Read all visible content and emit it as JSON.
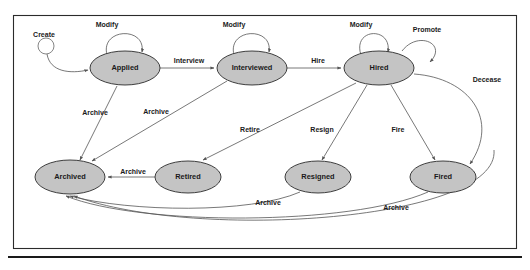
{
  "diagram": {
    "colors": {
      "node_fill": "#c4c4c4",
      "node_stroke": "#2b2b2b",
      "edge_stroke": "#555555",
      "background": "#ffffff",
      "frame": "#2b2b2b"
    },
    "start_node": {
      "label": "Create",
      "name": "start-node"
    },
    "states": [
      {
        "id": "applied",
        "label": "Applied",
        "cx": 125,
        "cy": 68,
        "rx": 35,
        "ry": 17
      },
      {
        "id": "interviewed",
        "label": "Interviewed",
        "cx": 252,
        "cy": 68,
        "rx": 35,
        "ry": 17
      },
      {
        "id": "hired",
        "label": "Hired",
        "cx": 379,
        "cy": 68,
        "rx": 35,
        "ry": 17
      },
      {
        "id": "archived",
        "label": "Archived",
        "cx": 70,
        "cy": 177,
        "rx": 35,
        "ry": 17
      },
      {
        "id": "retired",
        "label": "Retired",
        "cx": 188,
        "cy": 177,
        "rx": 33,
        "ry": 16
      },
      {
        "id": "resigned",
        "label": "Resigned",
        "cx": 318,
        "cy": 177,
        "rx": 33,
        "ry": 16
      },
      {
        "id": "fired",
        "label": "Fired",
        "cx": 443,
        "cy": 177,
        "rx": 33,
        "ry": 16
      }
    ],
    "transitions": [
      {
        "from": "start",
        "to": "applied",
        "label": "Create",
        "label_x": 44,
        "label_y": 35
      },
      {
        "from": "applied",
        "to": "applied",
        "label": "Modify",
        "label_x": 107,
        "label_y": 25
      },
      {
        "from": "applied",
        "to": "interviewed",
        "label": "Interview",
        "label_x": 189,
        "label_y": 61
      },
      {
        "from": "interviewed",
        "to": "interviewed",
        "label": "Modify",
        "label_x": 234,
        "label_y": 25
      },
      {
        "from": "interviewed",
        "to": "hired",
        "label": "Hire",
        "label_x": 318,
        "label_y": 61
      },
      {
        "from": "hired",
        "to": "hired",
        "label": "Modify",
        "label_x": 361,
        "label_y": 25
      },
      {
        "from": "hired",
        "to": "hired",
        "label": "Promote",
        "label_x": 427,
        "label_y": 30
      },
      {
        "from": "hired",
        "to": "fired",
        "label": "Decease",
        "label_x": 487,
        "label_y": 80
      },
      {
        "from": "applied",
        "to": "archived",
        "label": "Archive",
        "label_x": 95,
        "label_y": 113
      },
      {
        "from": "interviewed",
        "to": "archived",
        "label": "Archive",
        "label_x": 156,
        "label_y": 112
      },
      {
        "from": "hired",
        "to": "retired",
        "label": "Retire",
        "label_x": 250,
        "label_y": 130
      },
      {
        "from": "hired",
        "to": "resigned",
        "label": "Resign",
        "label_x": 322,
        "label_y": 130
      },
      {
        "from": "hired",
        "to": "fired",
        "label": "Fire",
        "label_x": 398,
        "label_y": 130
      },
      {
        "from": "retired",
        "to": "archived",
        "label": "Archive",
        "label_x": 133,
        "label_y": 172
      },
      {
        "from": "resigned",
        "to": "archived",
        "label": "Archive",
        "label_x": 268,
        "label_y": 203
      },
      {
        "from": "fired",
        "to": "archived",
        "label": "Archive",
        "label_x": 396,
        "label_y": 208
      }
    ]
  }
}
